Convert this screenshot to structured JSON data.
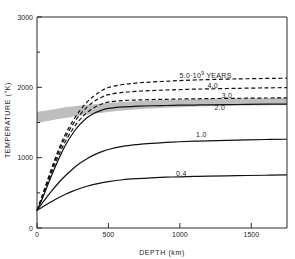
{
  "chart_data": {
    "type": "line",
    "title": "",
    "xlabel": "DEPTH  (km)",
    "ylabel": "TEMPERATURE  (°K)",
    "xlim": [
      0,
      1750
    ],
    "ylim": [
      0,
      3000
    ],
    "xticks": [
      0,
      500,
      1000,
      1500
    ],
    "xticklabels": [
      "0",
      "500",
      "1000",
      "1500"
    ],
    "yticks": [
      0,
      1000,
      2000,
      3000
    ],
    "yticklabels": [
      "0",
      "1000",
      "2000",
      "3000"
    ],
    "yminorticks": [
      500,
      1500,
      2500
    ],
    "grid": false,
    "legend": "inline-curve-labels",
    "annotations": [
      {
        "text": "5.0·10",
        "sup": "9",
        "tail": " YEARS",
        "x": 1180,
        "y": 2135,
        "name": "curve-label-5-0"
      },
      {
        "text": "4.0",
        "x": 1230,
        "y": 1985,
        "name": "curve-label-4-0"
      },
      {
        "text": "3.0",
        "x": 1330,
        "y": 1845,
        "name": "curve-label-3-0"
      },
      {
        "text": "2.0",
        "x": 1280,
        "y": 1672,
        "name": "curve-label-2-0"
      },
      {
        "text": "1.0",
        "x": 1150,
        "y": 1300,
        "name": "curve-label-1-0"
      },
      {
        "text": "0.4",
        "x": 1010,
        "y": 740,
        "name": "curve-label-0-4"
      }
    ],
    "shaded_band": {
      "name": "solidus-band",
      "color": "#b8b8b8",
      "label": "",
      "upper": [
        [
          0,
          1650
        ],
        [
          150,
          1700
        ],
        [
          300,
          1740
        ],
        [
          500,
          1778
        ],
        [
          750,
          1808
        ],
        [
          1000,
          1826
        ],
        [
          1250,
          1838
        ],
        [
          1500,
          1846
        ],
        [
          1750,
          1850
        ]
      ],
      "lower": [
        [
          0,
          1490
        ],
        [
          150,
          1548
        ],
        [
          300,
          1596
        ],
        [
          500,
          1650
        ],
        [
          750,
          1694
        ],
        [
          1000,
          1718
        ],
        [
          1250,
          1734
        ],
        [
          1500,
          1742
        ],
        [
          1750,
          1746
        ]
      ]
    },
    "series": [
      {
        "name": "5.0·10⁹ YEARS",
        "style": "dashed",
        "values": [
          [
            0,
            250
          ],
          [
            40,
            480
          ],
          [
            80,
            720
          ],
          [
            120,
            950
          ],
          [
            160,
            1160
          ],
          [
            200,
            1340
          ],
          [
            250,
            1520
          ],
          [
            300,
            1668
          ],
          [
            350,
            1790
          ],
          [
            400,
            1880
          ],
          [
            450,
            1948
          ],
          [
            500,
            1998
          ],
          [
            600,
            2040
          ],
          [
            700,
            2062
          ],
          [
            800,
            2076
          ],
          [
            900,
            2086
          ],
          [
            1000,
            2096
          ],
          [
            1100,
            2104
          ],
          [
            1200,
            2110
          ],
          [
            1400,
            2120
          ],
          [
            1600,
            2126
          ],
          [
            1750,
            2130
          ]
        ]
      },
      {
        "name": "4.0",
        "style": "dashed",
        "values": [
          [
            0,
            250
          ],
          [
            40,
            470
          ],
          [
            80,
            700
          ],
          [
            120,
            920
          ],
          [
            160,
            1120
          ],
          [
            200,
            1296
          ],
          [
            250,
            1470
          ],
          [
            300,
            1610
          ],
          [
            350,
            1718
          ],
          [
            400,
            1800
          ],
          [
            450,
            1856
          ],
          [
            500,
            1896
          ],
          [
            600,
            1928
          ],
          [
            700,
            1944
          ],
          [
            800,
            1954
          ],
          [
            900,
            1962
          ],
          [
            1000,
            1968
          ],
          [
            1100,
            1974
          ],
          [
            1200,
            1978
          ],
          [
            1400,
            1986
          ],
          [
            1600,
            1992
          ],
          [
            1750,
            1996
          ]
        ]
      },
      {
        "name": "3.0",
        "style": "dashed",
        "values": [
          [
            0,
            250
          ],
          [
            40,
            450
          ],
          [
            80,
            670
          ],
          [
            120,
            878
          ],
          [
            160,
            1068
          ],
          [
            200,
            1236
          ],
          [
            250,
            1404
          ],
          [
            300,
            1540
          ],
          [
            350,
            1640
          ],
          [
            400,
            1712
          ],
          [
            450,
            1760
          ],
          [
            500,
            1790
          ],
          [
            600,
            1812
          ],
          [
            700,
            1820
          ],
          [
            800,
            1826
          ],
          [
            900,
            1830
          ],
          [
            1000,
            1834
          ],
          [
            1100,
            1836
          ],
          [
            1200,
            1840
          ],
          [
            1400,
            1844
          ],
          [
            1600,
            1848
          ],
          [
            1750,
            1850
          ]
        ]
      },
      {
        "name": "2.0",
        "style": "solid",
        "values": [
          [
            0,
            250
          ],
          [
            40,
            430
          ],
          [
            80,
            636
          ],
          [
            120,
            832
          ],
          [
            160,
            1016
          ],
          [
            200,
            1180
          ],
          [
            250,
            1344
          ],
          [
            300,
            1472
          ],
          [
            350,
            1568
          ],
          [
            400,
            1632
          ],
          [
            450,
            1672
          ],
          [
            500,
            1700
          ],
          [
            600,
            1722
          ],
          [
            700,
            1732
          ],
          [
            800,
            1738
          ],
          [
            900,
            1742
          ],
          [
            1000,
            1746
          ],
          [
            1100,
            1748
          ],
          [
            1200,
            1752
          ],
          [
            1400,
            1756
          ],
          [
            1600,
            1760
          ],
          [
            1750,
            1762
          ]
        ]
      },
      {
        "name": "1.0",
        "style": "solid",
        "values": [
          [
            0,
            250
          ],
          [
            50,
            390
          ],
          [
            100,
            520
          ],
          [
            150,
            640
          ],
          [
            200,
            746
          ],
          [
            250,
            840
          ],
          [
            300,
            920
          ],
          [
            350,
            986
          ],
          [
            400,
            1040
          ],
          [
            450,
            1082
          ],
          [
            500,
            1116
          ],
          [
            600,
            1160
          ],
          [
            700,
            1186
          ],
          [
            800,
            1204
          ],
          [
            900,
            1216
          ],
          [
            1000,
            1226
          ],
          [
            1100,
            1234
          ],
          [
            1200,
            1240
          ],
          [
            1400,
            1250
          ],
          [
            1600,
            1258
          ],
          [
            1750,
            1262
          ]
        ]
      },
      {
        "name": "0.4",
        "style": "solid",
        "values": [
          [
            0,
            250
          ],
          [
            50,
            314
          ],
          [
            100,
            374
          ],
          [
            150,
            430
          ],
          [
            200,
            480
          ],
          [
            250,
            524
          ],
          [
            300,
            562
          ],
          [
            350,
            594
          ],
          [
            400,
            620
          ],
          [
            450,
            642
          ],
          [
            500,
            660
          ],
          [
            600,
            686
          ],
          [
            700,
            702
          ],
          [
            800,
            714
          ],
          [
            900,
            722
          ],
          [
            1000,
            728
          ],
          [
            1100,
            733
          ],
          [
            1200,
            737
          ],
          [
            1400,
            744
          ],
          [
            1600,
            750
          ],
          [
            1750,
            754
          ]
        ]
      }
    ]
  }
}
